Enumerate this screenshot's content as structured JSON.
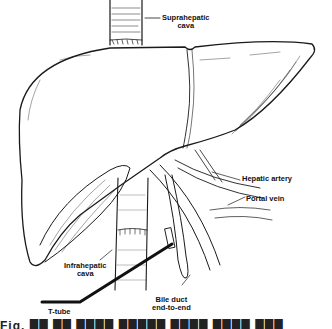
{
  "figure": {
    "type": "anatomical line illustration",
    "labels": {
      "suprahepatic_cava": [
        "Suprahepatic",
        "cava"
      ],
      "hepatic_artery": "Hepatic artery",
      "portal_vein": "Portal vein",
      "infrahepatic_cava": [
        "Infrahepatic",
        "cava"
      ],
      "t_tube": "T-tube",
      "bile_duct": [
        "Bile duct",
        "end-to-end"
      ]
    },
    "caption_partial": "Fig. ██ ██  ████ █████ ████ ████ ███"
  },
  "colors": {
    "ink": "#1a1a1a",
    "background": "#ffffff"
  }
}
